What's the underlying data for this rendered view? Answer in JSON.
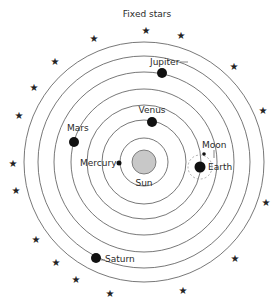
{
  "title": "Fixed stars",
  "center": {
    "x": 144,
    "y": 162
  },
  "sun": {
    "label": "Sun",
    "radius": 12,
    "fill": "#c8c8c8",
    "stroke": "#666666"
  },
  "orbits": [
    24,
    42,
    57,
    73,
    90,
    106,
    120
  ],
  "planets": [
    {
      "name": "Mercury",
      "x": 119,
      "y": 163,
      "r": 2.5,
      "label_x": 80,
      "label_y": 166,
      "anchor": "start"
    },
    {
      "name": "Venus",
      "x": 152,
      "y": 122,
      "r": 5,
      "label_x": 152,
      "label_y": 113,
      "anchor": "middle"
    },
    {
      "name": "Earth",
      "x": 200,
      "y": 167,
      "r": 5.5,
      "label_x": 208,
      "label_y": 170,
      "anchor": "start"
    },
    {
      "name": "Mars",
      "x": 74,
      "y": 142,
      "r": 5,
      "label_x": 67,
      "label_y": 131,
      "anchor": "start"
    },
    {
      "name": "Jupiter",
      "x": 162,
      "y": 73,
      "r": 5,
      "label_x": 150,
      "label_y": 65,
      "anchor": "start"
    },
    {
      "name": "Saturn",
      "x": 96,
      "y": 258,
      "r": 5,
      "label_x": 105,
      "label_y": 262,
      "anchor": "start"
    }
  ],
  "moon": {
    "name": "Moon",
    "x": 204,
    "y": 154,
    "r": 1.8,
    "label_x": 202,
    "label_y": 148,
    "epicycle_r": 12
  },
  "stars": [
    [
      146,
      30
    ],
    [
      94,
      38
    ],
    [
      181,
      35
    ],
    [
      55,
      61
    ],
    [
      234,
      66
    ],
    [
      34,
      87
    ],
    [
      19,
      115
    ],
    [
      263,
      110
    ],
    [
      13,
      163
    ],
    [
      16,
      190
    ],
    [
      266,
      202
    ],
    [
      36,
      239
    ],
    [
      235,
      258
    ],
    [
      56,
      262
    ],
    [
      76,
      279
    ],
    [
      110,
      293
    ],
    [
      183,
      290
    ]
  ],
  "star_glyph": "★"
}
